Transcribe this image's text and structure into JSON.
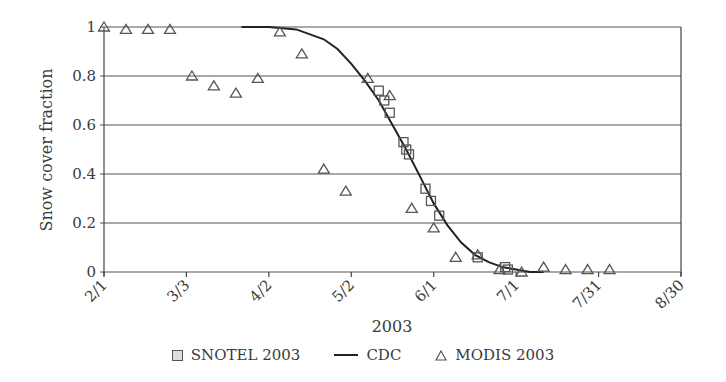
{
  "chart_data": {
    "type": "scatter",
    "title": "",
    "xlabel": "2003",
    "ylabel": "Snow cover fraction",
    "x_tick_labels": [
      "2/1",
      "3/3",
      "4/2",
      "5/2",
      "6/1",
      "7/1",
      "7/31",
      "8/30"
    ],
    "x_tick_days": [
      0,
      30,
      60,
      90,
      120,
      150,
      180,
      210
    ],
    "y_tick_labels": [
      "0",
      "0.2",
      "0.4",
      "0.6",
      "0.8",
      "1"
    ],
    "y_ticks": [
      0,
      0.2,
      0.4,
      0.6,
      0.8,
      1.0
    ],
    "xlim_days": [
      0,
      210
    ],
    "ylim": [
      0,
      1
    ],
    "grid": "horizontal",
    "legend_position": "bottom",
    "series": [
      {
        "name": "SNOTEL 2003",
        "marker": "square",
        "days_since_2_1": [
          100,
          102,
          104,
          109,
          110,
          111,
          117,
          119,
          122,
          136,
          146,
          147
        ],
        "values": [
          0.74,
          0.7,
          0.65,
          0.53,
          0.5,
          0.48,
          0.34,
          0.29,
          0.23,
          0.06,
          0.02,
          0.01
        ]
      },
      {
        "name": "CDC",
        "marker": "line",
        "days_since_2_1": [
          50,
          60,
          70,
          80,
          85,
          90,
          95,
          100,
          105,
          110,
          115,
          120,
          125,
          130,
          135,
          140,
          145,
          150,
          155,
          160
        ],
        "values": [
          1.0,
          1.0,
          0.99,
          0.95,
          0.91,
          0.85,
          0.78,
          0.7,
          0.6,
          0.5,
          0.39,
          0.28,
          0.19,
          0.12,
          0.07,
          0.04,
          0.02,
          0.01,
          0.0,
          0.0
        ]
      },
      {
        "name": "MODIS 2003",
        "marker": "triangle",
        "days_since_2_1": [
          0,
          8,
          16,
          24,
          32,
          40,
          48,
          56,
          64,
          72,
          80,
          88,
          96,
          104,
          112,
          120,
          128,
          136,
          144,
          152,
          160,
          168,
          176,
          184
        ],
        "values": [
          1.0,
          0.99,
          0.99,
          0.99,
          0.8,
          0.76,
          0.73,
          0.79,
          0.98,
          0.89,
          0.42,
          0.33,
          0.79,
          0.72,
          0.26,
          0.18,
          0.06,
          0.07,
          0.01,
          0.0,
          0.02,
          0.01,
          0.01,
          0.01
        ]
      }
    ]
  },
  "legend": {
    "items": [
      {
        "label": "SNOTEL 2003",
        "icon": "square-marker-icon"
      },
      {
        "label": "CDC",
        "icon": "line-icon"
      },
      {
        "label": "MODIS 2003",
        "icon": "triangle-marker-icon"
      }
    ]
  },
  "colors": {
    "axis": "#444444",
    "grid": "#555555",
    "curve": "#222222",
    "marker_stroke": "#555555",
    "square_fill": "#dddddd"
  }
}
